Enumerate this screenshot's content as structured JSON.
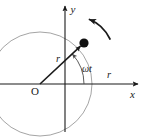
{
  "figure": {
    "kind": "physics-diagram",
    "width": 145,
    "height": 139,
    "background_color": "#ffffff"
  },
  "colors": {
    "circle_stroke": "#9a9a9a",
    "axis_stroke": "#1a1a1a",
    "vector_stroke": "#1a1a1a",
    "arc_stroke": "#4a4a4a",
    "rotation_arrow_stroke": "#1a1a1a",
    "particle_fill": "#111111",
    "label_color": "#1a1a1a"
  },
  "geometry": {
    "circle": {
      "cx": 40,
      "cy": 84,
      "r": 52
    },
    "origin": {
      "x": 40,
      "y": 84
    },
    "particle": {
      "x": 84,
      "y": 43
    },
    "y_axis": {
      "x": 65,
      "y_bottom": 132,
      "y_top": 5
    },
    "x_axis": {
      "y": 84,
      "x_left": 0,
      "x_right": 142
    },
    "angle_arc": {
      "cx": 40,
      "cy": 84,
      "radius": 44,
      "start_deg": 0,
      "end_deg": 43
    }
  },
  "labels": {
    "y_axis": "y",
    "x_axis": "x",
    "origin": "O",
    "radius_vector": "r",
    "radius_on_axis": "r",
    "angle": "ωt"
  },
  "annotations": {
    "rotation_direction": "counterclockwise",
    "particle_name": "particle"
  }
}
